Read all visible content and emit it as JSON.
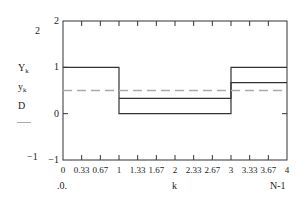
{
  "chart_data": {
    "type": "line",
    "step": true,
    "title": "",
    "xlabel": "k",
    "x_range_labels": {
      "left": "0",
      "right": "N-1"
    },
    "ylabel_stack": [
      "Y_k",
      "y_k",
      "D"
    ],
    "xlim": [
      0,
      4
    ],
    "ylim": [
      -1,
      2
    ],
    "xticks": [
      "0",
      "0.33",
      "0.67",
      "1",
      "1.33",
      "1.67",
      "2",
      "2.33",
      "2.67",
      "3",
      "3.33",
      "3.67",
      "4"
    ],
    "yticks": [
      "-1",
      "0",
      "1",
      "2"
    ],
    "y_outer_labels": {
      "top": "2",
      "bottom": "-1"
    },
    "grid": false,
    "series": [
      {
        "name": "Y_k",
        "style": "solid",
        "color": "#333333",
        "points": [
          [
            0,
            1
          ],
          [
            1,
            1
          ],
          [
            1,
            0
          ],
          [
            3,
            0
          ],
          [
            3,
            1
          ],
          [
            4,
            1
          ]
        ]
      },
      {
        "name": "y_k",
        "style": "solid",
        "color": "#333333",
        "points": [
          [
            1,
            0.33
          ],
          [
            3,
            0.33
          ],
          [
            3,
            0.67
          ],
          [
            4,
            0.67
          ]
        ]
      },
      {
        "name": "D",
        "style": "dashed",
        "color": "#aaaaaa",
        "points": [
          [
            0,
            0.5
          ],
          [
            4,
            0.5
          ]
        ]
      }
    ]
  }
}
